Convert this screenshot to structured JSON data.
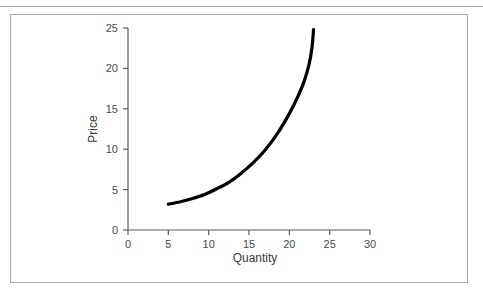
{
  "page": {
    "background_color": "#ffffff",
    "top_rule_color": "#9a9a9a",
    "cut_off_header_text": "",
    "frame_border_color": "#a8a8a8"
  },
  "chart_data": {
    "type": "line",
    "title": "",
    "subtitle": "",
    "xlabel": "Quantity",
    "ylabel": "Price",
    "xlim": [
      0,
      30
    ],
    "ylim": [
      0,
      25
    ],
    "xticks": [
      "0",
      "5",
      "10",
      "15",
      "20",
      "25",
      "30"
    ],
    "yticks": [
      "0",
      "5",
      "10",
      "15",
      "20",
      "25"
    ],
    "xtick_values": [
      0,
      5,
      10,
      15,
      20,
      25,
      30
    ],
    "ytick_values": [
      0,
      5,
      10,
      15,
      20,
      25
    ],
    "grid": false,
    "legend": null,
    "legend_position": "none",
    "annotations": [],
    "series": [
      {
        "name": "Supply",
        "color": "#000000",
        "line_width": 3.2,
        "x": [
          5.0,
          6.5,
          8.0,
          9.5,
          11.0,
          12.5,
          14.0,
          15.5,
          17.0,
          18.5,
          20.0,
          21.0,
          21.8,
          22.4,
          22.8,
          23.0
        ],
        "y": [
          3.2,
          3.5,
          3.9,
          4.4,
          5.1,
          5.9,
          7.0,
          8.3,
          9.9,
          11.9,
          14.4,
          16.4,
          18.3,
          20.3,
          22.5,
          24.8
        ]
      }
    ]
  },
  "axes_geometry": {
    "x_origin_px": 128,
    "y_origin_px": 230,
    "x_end_px": 370,
    "y_top_px": 28
  }
}
